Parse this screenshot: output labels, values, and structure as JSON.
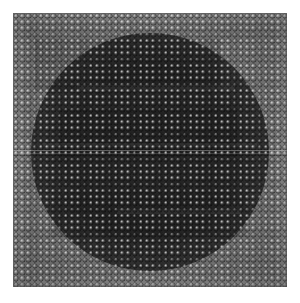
{
  "image": {
    "kind": "micrograph",
    "subject": "microlens-array",
    "description": "Grayscale micrograph of a square-lattice microlens / micro-pillar array with a dark circular illuminated aperture in the centre",
    "canvas": {
      "width": 300,
      "height": 303,
      "background": "#ffffff"
    },
    "specimen": {
      "left": 13,
      "top": 13,
      "width": 274,
      "height": 274
    },
    "colors": {
      "background": "#ffffff",
      "substrate": "#909090",
      "frame_border": "#b4b4b4",
      "disc_core": "#2a2a2a",
      "disc_mid": "#3a3a3a",
      "disc_edge": "#7c7c7c",
      "lattice_highlight": "#d8d8d8",
      "lattice_shadow": "#1e1e1e",
      "seam_highlight": "#ffffff"
    },
    "lattice": {
      "type": "square",
      "pitch_px": 6.25,
      "dot_diameter_px": 5.2,
      "columns": 44,
      "rows": 44
    },
    "aperture": {
      "shape": "circle",
      "center_x": 148,
      "center_y": 150,
      "radius_px": 116
    },
    "artifacts": [
      {
        "name": "scan-seam",
        "orientation": "horizontal",
        "y": 150,
        "thickness": 1
      },
      {
        "name": "scan-seam-secondary",
        "orientation": "horizontal",
        "y": 153,
        "thickness": 1
      },
      {
        "name": "terrace-step",
        "orientation": "rectangular",
        "count": 6
      }
    ]
  },
  "chart_data": {
    "type": "heatmap",
    "title": "",
    "xlabel": "",
    "ylabel": "",
    "grid": true,
    "legend": "none",
    "x": [
      0,
      44
    ],
    "y": [
      0,
      44
    ],
    "value_range": [
      0.12,
      0.86
    ],
    "radial_profile": {
      "r_norm": [
        0.0,
        0.2,
        0.4,
        0.55,
        0.7,
        0.8,
        0.88,
        0.94,
        1.0,
        1.1
      ],
      "intensity": [
        0.17,
        0.18,
        0.2,
        0.23,
        0.29,
        0.38,
        0.52,
        0.68,
        0.78,
        0.8
      ]
    }
  }
}
